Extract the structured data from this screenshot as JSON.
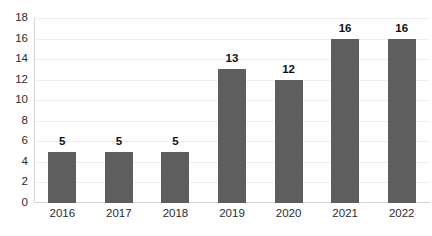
{
  "chart_data": {
    "type": "bar",
    "title": "",
    "subtitle": "",
    "xlabel": "",
    "ylabel": "",
    "categories": [
      "2016",
      "2017",
      "2018",
      "2019",
      "2020",
      "2021",
      "2022"
    ],
    "values": [
      5,
      5,
      5,
      13,
      12,
      16,
      16
    ],
    "data_labels": [
      "5",
      "5",
      "5",
      "13",
      "12",
      "16",
      "16"
    ],
    "ylim": [
      0,
      18
    ],
    "y_ticks": [
      0,
      2,
      4,
      6,
      8,
      10,
      12,
      14,
      16,
      18
    ],
    "y_tick_labels": [
      "0",
      "2",
      "4",
      "6",
      "8",
      "10",
      "12",
      "14",
      "16",
      "18"
    ],
    "grid": true,
    "grid_axis": "y",
    "legend": false,
    "legend_position": "none",
    "series": [
      {
        "name": "",
        "values": [
          5,
          5,
          5,
          13,
          12,
          16,
          16
        ]
      }
    ],
    "colors": {
      "bar": "#5e5e5e",
      "gridline": "#eeeeee",
      "axis": "#d4d4d4",
      "tick_label": "#2b2b2b",
      "data_label": "#111111",
      "background": "#ffffff"
    }
  }
}
